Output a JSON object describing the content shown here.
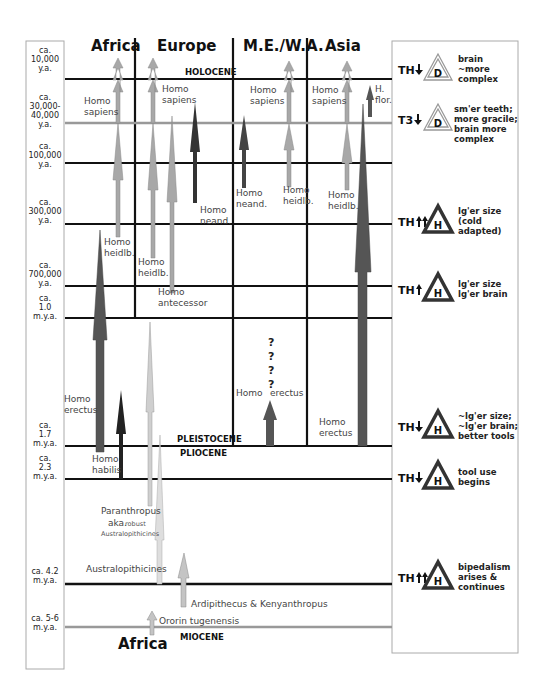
{
  "columns": [
    {
      "label": "Africa",
      "x": 113
    },
    {
      "label": "Europe",
      "x": 178
    },
    {
      "label": "M.E./W.A.",
      "x": 279
    },
    {
      "label": "Asia",
      "x": 345
    }
  ],
  "epochs": {
    "holocene": "HOLOCENE",
    "pleistocene": "PLEISTOCENE",
    "pliocene": "PLIOCENE",
    "miocene": "MIOCENE"
  },
  "time_labels": [
    {
      "lines": [
        "ca.",
        "10,000",
        "y.a."
      ],
      "y": 62
    },
    {
      "lines": [
        "ca.",
        "30,000-",
        "40,000",
        "y.a."
      ],
      "y": 113
    },
    {
      "lines": [
        "ca.",
        "100,000",
        "y.a."
      ],
      "y": 158
    },
    {
      "lines": [
        "ca.",
        "300,000",
        "y.a."
      ],
      "y": 214
    },
    {
      "lines": [
        "ca.",
        "700,000",
        "y.a."
      ],
      "y": 277
    },
    {
      "lines": [
        "ca.",
        "1.0",
        "m.y.a."
      ],
      "y": 310
    },
    {
      "lines": [
        "ca.",
        "1.7",
        "m.y.a."
      ],
      "y": 437
    },
    {
      "lines": [
        "ca.",
        "2.3",
        "m.y.a."
      ],
      "y": 470
    },
    {
      "lines": [
        "ca. 4.2",
        "m.y.a."
      ],
      "y": 578
    },
    {
      "lines": [
        "ca. 5-6",
        "m.y.a."
      ],
      "y": 625
    }
  ],
  "species_labels": {
    "africa_sapiens": [
      "Homo",
      "sapiens"
    ],
    "europe_sapiens": [
      "Homo",
      "sapiens"
    ],
    "mewa_sapiens": [
      "Homo",
      "sapiens"
    ],
    "asia_sapiens": [
      "Homo",
      "sapiens"
    ],
    "asia_flor": [
      "H.",
      "flor."
    ],
    "europe_neand": [
      "Homo",
      "neand."
    ],
    "mewa_neand": [
      "Homo",
      "neand."
    ],
    "mewa_heidlb": [
      "Homo",
      "heidlb."
    ],
    "asia_heidlb": [
      "Homo",
      "heidlb."
    ],
    "africa_heidlb": [
      "Homo",
      "heidlb."
    ],
    "europe_heidlb": [
      "Homo",
      "heidlb."
    ],
    "europe_antecessor": [
      "Homo",
      "antecessor"
    ],
    "africa_erectus": [
      "Homo",
      "erectus"
    ],
    "mewa_erectus_homo": "Homo",
    "mewa_erectus_erectus": "erectus",
    "asia_erectus": [
      "Homo",
      "erectus"
    ],
    "africa_habilis": [
      "Homo",
      "habilis"
    ],
    "paranthropus": [
      "Paranthropus",
      "aka.",
      "robust",
      "Australopithicines"
    ],
    "australopithicines": "Australopithicines",
    "ardipithecus": "Ardipithecus & Kenyanthropus",
    "orrorin": "Ororin tugenensis",
    "bottom_africa": "Africa"
  },
  "question_marks": [
    "?",
    "?",
    "?",
    "?"
  ],
  "legend": [
    {
      "marker": "TH",
      "arrows": "down",
      "letter": "D",
      "type": "double",
      "text": [
        "brain",
        "~more",
        "complex"
      ],
      "y": 70
    },
    {
      "marker": "T3",
      "arrows": "down",
      "letter": "D",
      "type": "double",
      "text": [
        "sm'er  teeth;",
        "more gracile;",
        "brain more",
        "complex"
      ],
      "y": 120
    },
    {
      "marker": "TH",
      "arrows": "up2",
      "letter": "H",
      "type": "solid",
      "text": [
        "lg'er size",
        "(cold",
        "adapted)"
      ],
      "y": 222
    },
    {
      "marker": "TH",
      "arrows": "up1",
      "letter": "H",
      "type": "solid",
      "text": [
        "lg'er size",
        "lg'er brain"
      ],
      "y": 290
    },
    {
      "marker": "TH",
      "arrows": "down",
      "letter": "H",
      "type": "solid",
      "text": [
        "~lg'er size;",
        "~lg'er brain;",
        "better tools"
      ],
      "y": 427
    },
    {
      "marker": "TH",
      "arrows": "down",
      "letter": "H",
      "type": "solid",
      "text": [
        "tool use",
        "begins"
      ],
      "y": 478
    },
    {
      "marker": "TH",
      "arrows": "up2",
      "letter": "H",
      "type": "solid",
      "text": [
        "bipedalism",
        "arises &",
        "continues"
      ],
      "y": 578
    }
  ],
  "colors": {
    "grid": "#111111",
    "grid_light": "#999999",
    "arrow_light": "#c4c4c4",
    "arrow_mid": "#9a9a9a",
    "arrow_dark": "#555555",
    "arrow_black": "#222222",
    "panel_border": "#aaaaaa"
  }
}
